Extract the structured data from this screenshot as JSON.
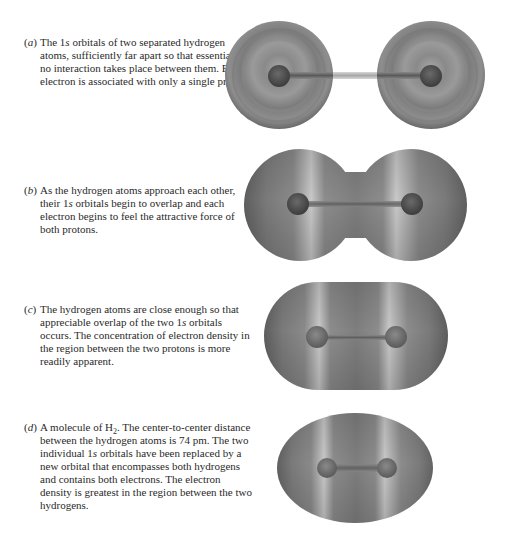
{
  "figure": {
    "panels": [
      {
        "label_open": "(",
        "label_letter": "a",
        "label_close": ")",
        "text_parts": [
          "The 1",
          "s",
          " orbitals of two separated hydrogen atoms, sufficiently far apart so that essentially no interaction takes place between them. Each electron is associated with only a single proton."
        ],
        "illustration": "two separate spherical 1s orbitals with nuclei connected by a rod"
      },
      {
        "label_open": "(",
        "label_letter": "b",
        "label_close": ")",
        "text_parts": [
          "As the hydrogen atoms approach each other, their 1",
          "s",
          " orbitals begin to overlap and each electron begins to feel the attractive force of both protons."
        ],
        "illustration": "two overlapping spheres forming a dumbbell shape"
      },
      {
        "label_open": "(",
        "label_letter": "c",
        "label_close": ")",
        "text_parts": [
          "The hydrogen atoms are close enough so that appreciable overlap of the two 1",
          "s",
          " orbitals occurs. The concentration of electron density in the region between the two protons is more readily apparent."
        ],
        "illustration": "elongated capsule-shaped merged orbital"
      },
      {
        "label_open": "(",
        "label_letter": "d",
        "label_close": ")",
        "text_before_sub": "A molecule of H",
        "subscript": "2",
        "text_after_sub": ". The center-to-center distance between the hydrogen atoms is 74 pm. The two individual 1",
        "italic_s": "s",
        "text_end": " orbitals have been replaced by a new orbital that encompasses both hydrogens and contains both electrons. The electron density is greatest in the region between the two hydrogens.",
        "illustration": "oval H2 molecular orbital"
      }
    ],
    "colors": {
      "text": "#2a2a2a",
      "orbital_dark": "#5a5a5a",
      "orbital_mid": "#8c8c8c",
      "orbital_light": "#c4c4c4",
      "nucleus": "#4a4a4a"
    }
  }
}
